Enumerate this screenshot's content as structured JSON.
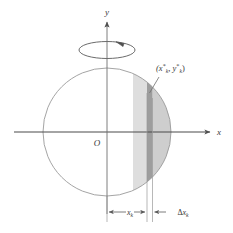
{
  "figure": {
    "kind": "solid-of-revolution-disk-diagram",
    "background_color": "#ffffff",
    "stroke_color": "#5a5a5a",
    "text_color": "#3a3a3a",
    "axes": {
      "y_axis_label": "y",
      "x_axis_label": "x",
      "origin_label": "O",
      "x_axis": {
        "x1": 14,
        "y1": 132,
        "x2": 216,
        "y2": 132
      },
      "y_axis": {
        "x1": 107,
        "y1": 212,
        "x2": 107,
        "y2": 16
      }
    },
    "circle": {
      "center_x": 107,
      "center_y": 132,
      "radius": 64,
      "stroke_color": "#8d8d8d",
      "fill": "none"
    },
    "rotation_arrow": {
      "name": "rotation-ellipse",
      "center_x": 107,
      "center_y": 50,
      "rx": 28,
      "ry": 9,
      "direction": "counterclockwise-viewed-from-top",
      "stroke_color": "#4f4f4f"
    },
    "shaded": {
      "left_region_color": "#dcdcdc",
      "strip_color": "#9a9a9a",
      "right_region_color": "#cccccc",
      "strip_left_x": 147,
      "strip_right_x": 152.5,
      "left_region_start_x": 133
    },
    "point_label": {
      "text_open": "(",
      "x_var": "x",
      "x_star": "*",
      "x_sub": "k",
      "separator": ", ",
      "y_var": "y",
      "y_star": "*",
      "y_sub": "k",
      "text_close": ")",
      "full_text": "(x*k, y*k)",
      "label_x": 156,
      "label_y": 72
    },
    "leader_line": {
      "x1": 158,
      "y1": 76,
      "x2": 149,
      "y2": 92
    },
    "dimensions": [
      {
        "name": "x-sub-k",
        "var": "x",
        "sub": "k",
        "delta": "",
        "from_x": 107,
        "to_x": 147,
        "y": 212,
        "label_text": "xk"
      },
      {
        "name": "delta-x-sub-k",
        "var": "x",
        "sub": "k",
        "delta": "Δ",
        "from_x": 152.5,
        "to_x": 186,
        "y": 212,
        "label_text": "Δxk"
      }
    ],
    "extension_lines": [
      {
        "name": "extension-line-left",
        "x": 147,
        "y1": 92,
        "y2": 222
      },
      {
        "name": "extension-line-right",
        "x": 152.5,
        "y1": 96,
        "y2": 222
      },
      {
        "name": "extension-line-axis",
        "x": 107,
        "y1": 196,
        "y2": 222
      }
    ]
  }
}
